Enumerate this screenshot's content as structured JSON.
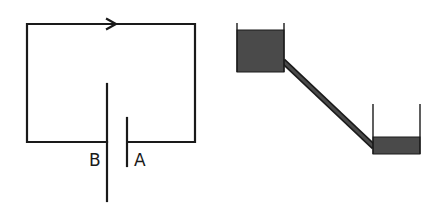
{
  "diagram": {
    "circuit": {
      "name": "battery-circuit",
      "labels": {
        "left_terminal": "B",
        "right_terminal": "A"
      },
      "current_direction": "clockwise-arrow-right-on-top-wire"
    },
    "water_analogy": {
      "name": "connected-water-containers",
      "upper_container": "high-water-level",
      "lower_container": "low-water-level",
      "connection": "diagonal-pipe"
    },
    "colors": {
      "line": "#1a1a1a",
      "water": "#4a4a4a",
      "background": "#ffffff"
    }
  }
}
